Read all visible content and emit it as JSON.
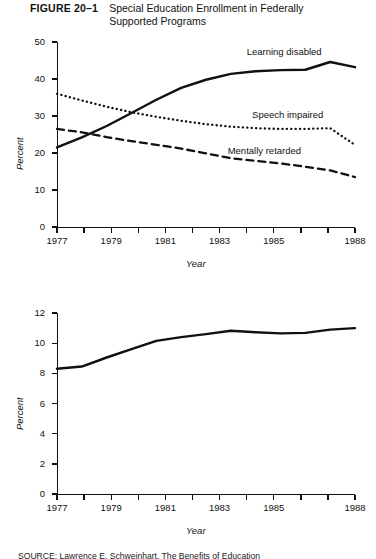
{
  "figure": {
    "number_label": "FIGURE 20–1",
    "title": "Special Education Enrollment in Federally Supported Programs",
    "source_note": "SOURCE: Lawrence  E.  Schweinhart,  The  Benefits  of  Education"
  },
  "chart_data": [
    {
      "type": "line",
      "title": "",
      "xlabel": "Year",
      "ylabel": "Percent",
      "xlim": [
        1977,
        1988
      ],
      "ylim": [
        0,
        50
      ],
      "ytick_values": [
        0,
        10,
        20,
        30,
        40,
        50
      ],
      "ytick_labels": [
        "0",
        "10",
        "20",
        "30",
        "40",
        "50"
      ],
      "xtick_values": [
        1977,
        1978,
        1979,
        1980,
        1981,
        1982,
        1983,
        1984,
        1985,
        1986,
        1987,
        1988
      ],
      "xtick_labels": [
        "1977",
        "",
        "1979",
        "",
        "1981",
        "",
        "1983",
        "",
        "1985",
        "",
        "",
        "1988"
      ],
      "grid": false,
      "legend_position": "inline-annotations",
      "x": [
        1977,
        1978,
        1979,
        1980,
        1981,
        1982,
        1983,
        1984,
        1985,
        1986,
        1987,
        1988
      ],
      "series": [
        {
          "name": "Learning disabled",
          "style": "solid",
          "values": [
            21.5,
            24.2,
            27.3,
            30.8,
            34.4,
            37.6,
            39.8,
            41.4,
            42.1,
            42.4,
            42.5,
            44.6,
            43.2
          ],
          "label_x": 1984.0,
          "label_y": 47.2
        },
        {
          "name": "Speech impaired",
          "style": "dotted",
          "values": [
            36.0,
            34.2,
            32.5,
            31.0,
            29.8,
            28.7,
            27.8,
            27.1,
            26.7,
            26.5,
            26.5,
            26.7,
            22.2
          ],
          "label_x": 1984.2,
          "label_y": 30.4
        },
        {
          "name": "Mentally retarded",
          "style": "dashed",
          "values": [
            26.5,
            25.6,
            24.3,
            23.2,
            22.2,
            21.2,
            19.9,
            18.6,
            17.9,
            17.2,
            16.3,
            15.3,
            13.5
          ],
          "label_x": 1983.3,
          "label_y": 20.6
        }
      ]
    },
    {
      "type": "line",
      "title": "",
      "xlabel": "Year",
      "ylabel": "Percent",
      "xlim": [
        1977,
        1988
      ],
      "ylim": [
        0,
        12
      ],
      "ytick_values": [
        0,
        2,
        4,
        6,
        8,
        10,
        12
      ],
      "ytick_labels": [
        "0",
        "2",
        "4",
        "6",
        "8",
        "10",
        "12"
      ],
      "xtick_values": [
        1977,
        1978,
        1979,
        1980,
        1981,
        1982,
        1983,
        1984,
        1985,
        1986,
        1987,
        1988
      ],
      "xtick_labels": [
        "1977",
        "",
        "1979",
        "",
        "1981",
        "",
        "1983",
        "",
        "1985",
        "",
        "",
        "1988"
      ],
      "grid": false,
      "legend_position": "none",
      "x": [
        1977,
        1978,
        1979,
        1980,
        1981,
        1982,
        1983,
        1984,
        1985,
        1986,
        1987,
        1988
      ],
      "series": [
        {
          "name": "Total enrollment in federally supported programs",
          "style": "solid",
          "values": [
            8.3,
            8.45,
            9.05,
            9.6,
            10.15,
            10.4,
            10.6,
            10.82,
            10.72,
            10.65,
            10.68,
            10.9,
            11.0
          ]
        }
      ]
    }
  ]
}
